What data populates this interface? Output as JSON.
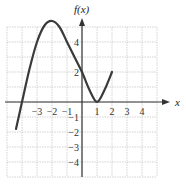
{
  "chart_data": {
    "type": "line",
    "title": "",
    "xlabel": "x",
    "ylabel": "f(x)",
    "xlim": [
      -5,
      5
    ],
    "ylim": [
      -5,
      5
    ],
    "grid": true,
    "x_tick_labels": [
      "-3",
      "-2",
      "-1",
      "1",
      "2",
      "3",
      "4"
    ],
    "y_tick_labels": [
      "4",
      "2",
      "-1",
      "-2",
      "-3",
      "-4"
    ],
    "series": [
      {
        "name": "f(x)",
        "x": [
          -4.4,
          -4,
          -3.5,
          -3,
          -2.5,
          -2,
          -1.5,
          -1,
          -0.5,
          0,
          0.5,
          1,
          1.5,
          2
        ],
        "y": [
          -1.8,
          0,
          2.2,
          4.0,
          5.1,
          5.4,
          5.0,
          4.0,
          3.0,
          2.0,
          0.8,
          0,
          0.8,
          2.0
        ]
      }
    ],
    "key_points": {
      "local_max": [
        -2,
        5.4
      ],
      "y_intercept": [
        0,
        2
      ],
      "local_min": [
        1,
        0
      ],
      "end_point": [
        2,
        2
      ],
      "start_point": [
        -4.4,
        -1.8
      ]
    }
  },
  "labels": {
    "y_axis": "f(x)",
    "x_axis": "x"
  }
}
